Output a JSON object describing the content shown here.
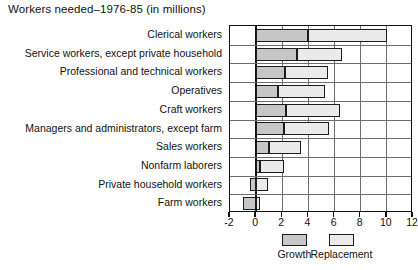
{
  "chart_data": {
    "type": "bar",
    "orientation": "horizontal",
    "stacked": true,
    "title": "Workers needed–1976-85 (in millions)",
    "xlabel": "",
    "ylabel": "",
    "xlim": [
      -2,
      12
    ],
    "xticks": [
      -2,
      0,
      2,
      4,
      6,
      8,
      10,
      12
    ],
    "xtick_labels": [
      "-2",
      "0",
      "2",
      "4",
      "6",
      "8",
      "10",
      "12"
    ],
    "grid": true,
    "legend_position": "bottom",
    "categories": [
      "Clerical workers",
      "Service workers, except private household",
      "Professional and technical workers",
      "Operatives",
      "Craft workers",
      "Managers and administrators, except farm",
      "Sales workers",
      "Nonfarm laborers",
      "Private household workers",
      "Farm workers"
    ],
    "series": [
      {
        "name": "Growth",
        "color": "#c6c6c6",
        "values": [
          4.0,
          3.1,
          2.2,
          1.7,
          2.3,
          2.1,
          1.0,
          0.3,
          -0.5,
          -1.0
        ]
      },
      {
        "name": "Replacement",
        "color": "#eaeaea",
        "values": [
          6.0,
          3.5,
          3.3,
          3.6,
          4.1,
          3.5,
          2.4,
          1.8,
          0.9,
          0.3
        ]
      }
    ],
    "totals": [
      10.0,
      6.6,
      5.5,
      5.3,
      6.4,
      5.6,
      3.4,
      2.1,
      0.9,
      0.3
    ]
  },
  "legend": {
    "entries": [
      {
        "label": "Growth",
        "color": "#c6c6c6"
      },
      {
        "label": "Replacement",
        "color": "#eaeaea"
      }
    ]
  }
}
